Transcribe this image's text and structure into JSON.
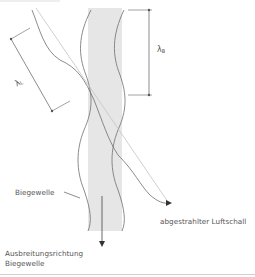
{
  "diagram": {
    "labels": {
      "bending_wave": "Biegewelle",
      "propagation_direction_line1": "Ausbreitungsrichtung",
      "propagation_direction_line2": "Biegewelle",
      "radiated_airborne_sound": "abgestrahlter Luftschall"
    },
    "symbols": {
      "lambda_air": {
        "base": "λ",
        "sub": "L"
      },
      "lambda_bending": {
        "base": "λ",
        "sub": "B"
      }
    },
    "colors": {
      "plate_fill": "#e6e6e6",
      "lines": "#6e6e6e",
      "light_lines": "#b8b8b8",
      "text": "#555555"
    }
  }
}
